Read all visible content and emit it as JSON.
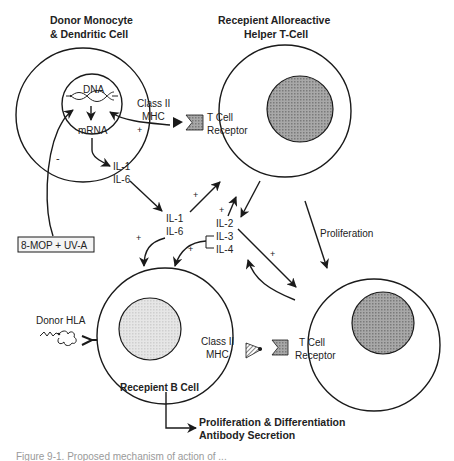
{
  "figure": {
    "caption": "Figure 9-1. Proposed mechanism of action of ...",
    "colors": {
      "line": "#1a1a1a",
      "nucleus_dark": "#9a9a9a",
      "nucleus_light": "#dcdcdc",
      "caption": "#9a9a9a"
    }
  },
  "cells": {
    "donor": {
      "title_line1": "Donor Monocyte",
      "title_line2": "& Dendritic Cell",
      "dna": "DNA",
      "mrna": "mRNA",
      "mhc_line1": "Class II",
      "mhc_line2": "MHC",
      "plus": "+",
      "il1": "IL-1",
      "il6": "IL-6"
    },
    "helper_t": {
      "title_line1": "Recepient Alloreactive",
      "title_line2": "Helper T-Cell",
      "receptor_line1": "T Cell",
      "receptor_line2": "Receptor"
    },
    "b_cell": {
      "title": "Recepient B Cell",
      "mhc_line1": "Class II",
      "mhc_line2": "MHC",
      "donor_hla": "Donor HLA"
    },
    "t_cell_2": {
      "receptor_line1": "T Cell",
      "receptor_line2": "Receptor"
    }
  },
  "treatment": {
    "label": "8-MOP + UV-A",
    "effect": "-"
  },
  "cytokines": {
    "il1": "IL-1",
    "il6": "IL-6",
    "il2": "IL-2",
    "il3": "IL-3",
    "il4": "IL-4"
  },
  "signs": {
    "plus": "+"
  },
  "process": {
    "proliferation": "Proliferation",
    "outcome_line1": "Proliferation & Differentiation",
    "outcome_line2": "Antibody Secretion"
  }
}
